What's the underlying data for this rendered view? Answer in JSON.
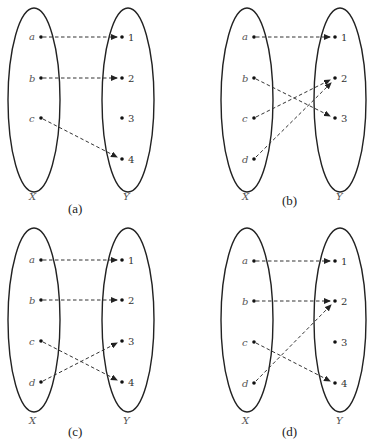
{
  "panels": [
    {
      "id": "a",
      "caption": "(a)",
      "set_x_label": "X",
      "set_y_label": "Y",
      "domain": [
        "a",
        "b",
        "c"
      ],
      "codomain": [
        "1",
        "2",
        "3",
        "4"
      ],
      "mappings": [
        [
          "a",
          "1"
        ],
        [
          "b",
          "2"
        ],
        [
          "c",
          "4"
        ]
      ]
    },
    {
      "id": "b",
      "caption": "(b)",
      "set_x_label": "X",
      "set_y_label": "Y",
      "domain": [
        "a",
        "b",
        "c",
        "d"
      ],
      "codomain": [
        "1",
        "2",
        "3"
      ],
      "mappings": [
        [
          "a",
          "1"
        ],
        [
          "b",
          "3"
        ],
        [
          "c",
          "2"
        ],
        [
          "d",
          "2"
        ]
      ]
    },
    {
      "id": "c",
      "caption": "(c)",
      "set_x_label": "X",
      "set_y_label": "Y",
      "domain": [
        "a",
        "b",
        "c",
        "d"
      ],
      "codomain": [
        "1",
        "2",
        "3",
        "4"
      ],
      "mappings": [
        [
          "a",
          "1"
        ],
        [
          "b",
          "2"
        ],
        [
          "c",
          "4"
        ],
        [
          "d",
          "3"
        ]
      ]
    },
    {
      "id": "d",
      "caption": "(d)",
      "set_x_label": "X",
      "set_y_label": "Y",
      "domain": [
        "a",
        "b",
        "c",
        "d"
      ],
      "codomain": [
        "1",
        "2",
        "3",
        "4"
      ],
      "mappings": [
        [
          "a",
          "1"
        ],
        [
          "b",
          "2"
        ],
        [
          "c",
          "4"
        ],
        [
          "d",
          "2"
        ]
      ]
    }
  ]
}
